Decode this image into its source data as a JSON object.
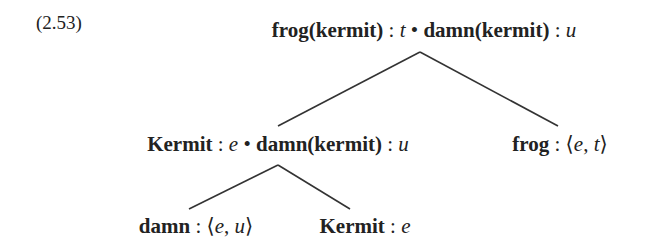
{
  "example_number": "(2.53)",
  "tree": {
    "root": {
      "left_term": "frog(kermit)",
      "left_type": "t",
      "bullet": "•",
      "right_term": "damn(kermit)",
      "right_type": "u"
    },
    "mid_left": {
      "left_term": "Kermit",
      "left_type": "e",
      "bullet": "•",
      "right_term": "damn(kermit)",
      "right_type": "u"
    },
    "mid_right": {
      "term": "frog",
      "type_open": "⟨",
      "type_a": "e",
      "type_b": "t",
      "type_close": "⟩"
    },
    "leaf_left": {
      "term": "damn",
      "type_open": "⟨",
      "type_a": "e",
      "type_b": "u",
      "type_close": "⟩"
    },
    "leaf_right": {
      "term": "Kermit",
      "type": "e"
    }
  },
  "colon": ":",
  "comma": ","
}
